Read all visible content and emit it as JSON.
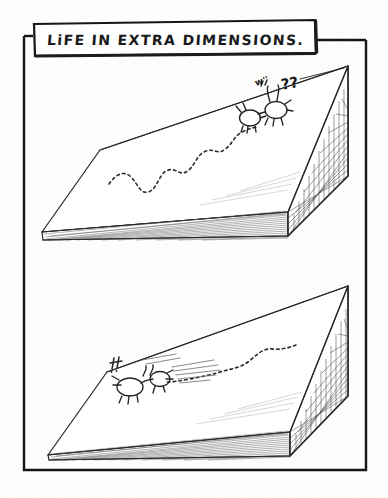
{
  "comic": {
    "title_caption": "LiFE  IN  EXTRA  DIMENSIONS.",
    "panels": [
      {
        "id": "panel-top",
        "name": "top-panel",
        "description": "Flat slab world with a wandering dashed trail leading to a creature that has just reached a vertical grid wall",
        "sound_marks": "w''",
        "speech_marks": "??",
        "creature_count": 2,
        "trail_style": "dashed-wandering"
      },
      {
        "id": "panel-bottom",
        "name": "bottom-panel",
        "description": "Same slab world; the creature flees left away from the grid wall leaving a dashed trail and speed lines",
        "sound_marks": "!!",
        "speech_marks": "",
        "creature_count": 1,
        "trail_style": "dashed-retreating"
      }
    ],
    "colors": {
      "ink": "#1c1c1c",
      "paper": "#fdfdfc",
      "hatch": "#555555",
      "frame": "#161616"
    }
  }
}
